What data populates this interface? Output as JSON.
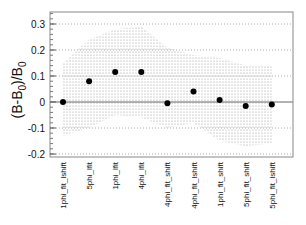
{
  "chart_data": {
    "type": "scatter",
    "title": "",
    "xlabel": "",
    "ylabel": "(B-B0)/B0",
    "ylim": [
      -0.22,
      0.35
    ],
    "yticks": [
      -0.2,
      -0.1,
      0,
      0.1,
      0.2,
      0.3
    ],
    "ytick_labels": [
      "-0.2",
      "-0.1",
      "0",
      "0.1",
      "0.2",
      "0.3"
    ],
    "grid": "horizontal dotted at major y ticks",
    "categories": [
      "1phi_fit_lshift",
      "5phi_lfit",
      "1phi_lfit",
      "4phi_lfit",
      "4phi_fit_shift",
      "4phi_fit_lshift",
      "1phi_fit_shift",
      "5phi_fit_shift",
      "5phi_fit_lshift"
    ],
    "series": [
      {
        "name": "central",
        "values": [
          0.0,
          0.08,
          0.115,
          0.115,
          -0.005,
          0.04,
          0.008,
          -0.015,
          -0.01
        ]
      }
    ],
    "band": {
      "description": "grey hatched uncertainty band",
      "upper": [
        0.15,
        0.24,
        0.28,
        0.29,
        0.21,
        0.18,
        0.17,
        0.14,
        0.14
      ],
      "lower": [
        -0.13,
        -0.1,
        -0.05,
        -0.06,
        -0.1,
        -0.08,
        -0.15,
        -0.17,
        -0.16
      ]
    },
    "reference_line": 0
  }
}
